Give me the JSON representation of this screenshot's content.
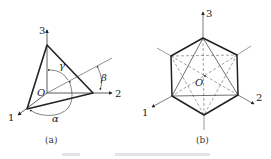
{
  "figure": {
    "panels": [
      {
        "id": "a",
        "caption": "(a)",
        "axes": [
          "1",
          "2",
          "3"
        ],
        "origin_label": "O",
        "angle_labels": [
          "α",
          "β",
          "γ"
        ],
        "description": "Plane intersecting three coordinate axes forming triangle; normal direction angles α, β, γ"
      },
      {
        "id": "b",
        "caption": "(b)",
        "axes": [
          "1",
          "2",
          "3"
        ],
        "origin_label": "O",
        "description": "Octahedron projected along body diagonal: hexagon outline with solid and dashed triangles"
      }
    ],
    "colors": {
      "line": "#222222",
      "thin": "#555555",
      "background": "#ffffff"
    }
  }
}
